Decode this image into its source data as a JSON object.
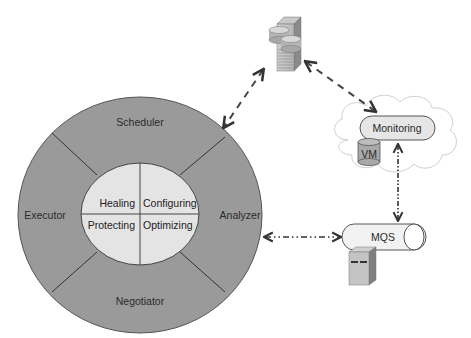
{
  "diagram": {
    "type": "architecture",
    "outer_ring": {
      "color": "#9a9a9a",
      "segments": [
        {
          "label": "Scheduler",
          "position": "top"
        },
        {
          "label": "Analyzer",
          "position": "right"
        },
        {
          "label": "Negotiator",
          "position": "bottom"
        },
        {
          "label": "Executor",
          "position": "left"
        }
      ]
    },
    "inner_core": {
      "color": "#e4e4e4",
      "quadrants": [
        {
          "label": "Healing",
          "position": "top-left"
        },
        {
          "label": "Configuring",
          "position": "top-right"
        },
        {
          "label": "Protecting",
          "position": "bottom-left"
        },
        {
          "label": "Optimizing",
          "position": "bottom-right"
        }
      ]
    },
    "nodes": [
      {
        "id": "server",
        "icon": "database-server-icon",
        "position": "top-center"
      },
      {
        "id": "monitoring",
        "label": "Monitoring",
        "container": "cloud",
        "position": "top-right"
      },
      {
        "id": "vm",
        "label": "VM",
        "icon": "cylinder-icon",
        "position": "top-right"
      },
      {
        "id": "mqs",
        "label": "MQS",
        "icon": "queue-pipe-icon",
        "position": "middle-right"
      },
      {
        "id": "mqs-server",
        "icon": "server-tower-icon",
        "position": "bottom-right"
      }
    ],
    "connections": [
      {
        "from": "server",
        "to": "outer_ring",
        "style": "dashed",
        "direction": "bidirectional"
      },
      {
        "from": "server",
        "to": "monitoring",
        "style": "dashed",
        "direction": "bidirectional"
      },
      {
        "from": "monitoring",
        "to": "mqs",
        "style": "dash-dot-dot",
        "direction": "bidirectional"
      },
      {
        "from": "outer_ring",
        "to": "mqs",
        "style": "dash-dot-dot",
        "direction": "bidirectional"
      }
    ]
  }
}
